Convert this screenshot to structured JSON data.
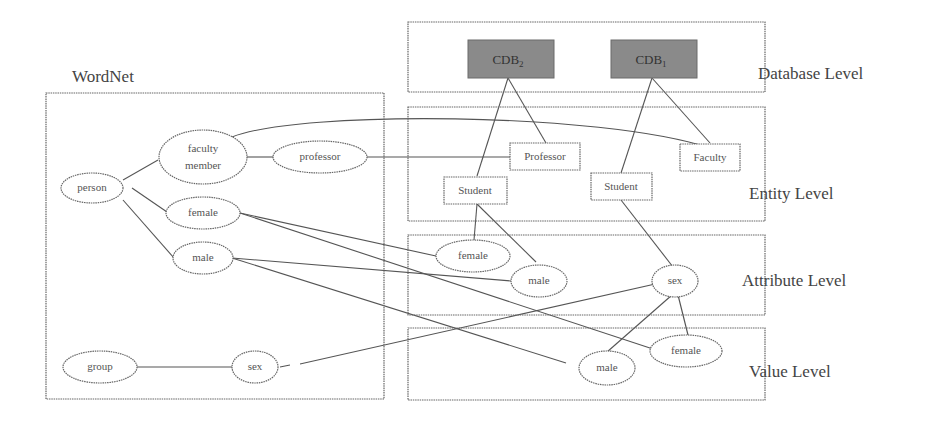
{
  "wordnet": {
    "title": "WordNet",
    "nodes": {
      "person": "person",
      "faculty_member_1": "faculty",
      "faculty_member_2": "member",
      "professor": "professor",
      "female": "female",
      "male": "male",
      "group": "group",
      "sex": "sex"
    }
  },
  "levels": {
    "database": {
      "label": "Database Level",
      "nodes": {
        "cdb_left": "CDB",
        "cdb_left_sub": "2",
        "cdb_right": "CDB",
        "cdb_right_sub": "1"
      }
    },
    "entity": {
      "label": "Entity Level",
      "nodes": {
        "professor": "Professor",
        "faculty": "Faculty",
        "student_left": "Student",
        "student_right": "Student"
      }
    },
    "attribute": {
      "label": "Attribute Level",
      "nodes": {
        "female": "female",
        "male": "male",
        "sex": "sex"
      }
    },
    "value": {
      "label": "Value Level",
      "nodes": {
        "male": "male",
        "female": "female"
      }
    }
  },
  "colors": {
    "line": "#555555",
    "border": "#666666",
    "db_fill": "#8a8a8a"
  }
}
